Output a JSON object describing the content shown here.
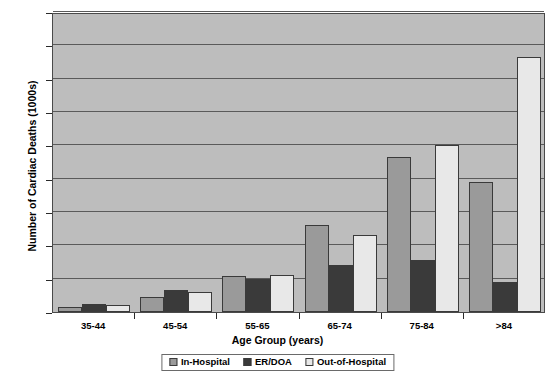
{
  "chart_data": {
    "type": "bar",
    "title": "",
    "xlabel": "Age Group (years)",
    "ylabel": "Number of Cardiac Deaths (1000s)",
    "categories": [
      "35-44",
      "45-54",
      "55-65",
      "65-74",
      "75-84",
      ">84"
    ],
    "series": [
      {
        "name": "In-Hospital",
        "color": "#9a9a9a",
        "values": [
          3,
          9,
          21.5,
          52,
          93,
          78
        ]
      },
      {
        "name": "ER/DOA",
        "color": "#3a3a3a",
        "values": [
          5,
          13,
          20,
          28,
          31,
          18
        ]
      },
      {
        "name": "Out-of-Hospital",
        "color": "#e8e8e8",
        "values": [
          4.5,
          12,
          22,
          46,
          100,
          153
        ]
      }
    ],
    "ylim": [
      0,
      180
    ],
    "yticks": [
      0,
      20,
      40,
      60,
      80,
      100,
      120,
      140,
      160,
      180
    ],
    "ytick_labels": [
      "0",
      "20",
      "40",
      "60",
      "80",
      "100",
      "120",
      "140",
      "160",
      "180"
    ],
    "grid": true,
    "legend_position": "bottom",
    "plot_background": "#bdbdbd",
    "gridline_color": "#5a5a5a",
    "axis_color": "#2a2a2a"
  }
}
